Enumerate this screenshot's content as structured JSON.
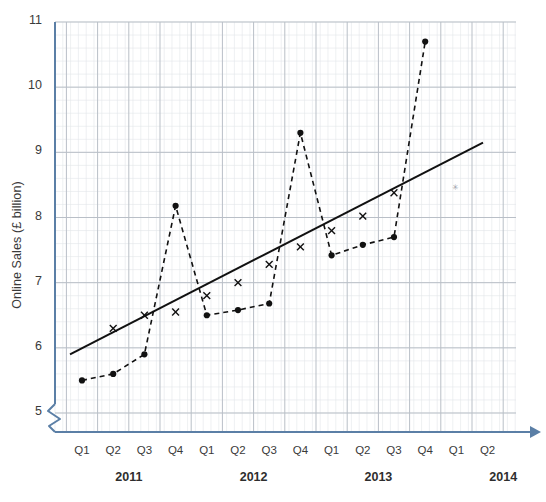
{
  "chart_data": {
    "type": "line",
    "title": "",
    "xlabel": "",
    "ylabel": "Online Sales (£ billion)",
    "ylim": [
      5,
      11
    ],
    "yticks": [
      5,
      6,
      7,
      8,
      9,
      10,
      11
    ],
    "ytick_labels": [
      "5",
      "6",
      "7",
      "8",
      "9",
      "10",
      "11"
    ],
    "axis_break": true,
    "grid": true,
    "grid_minor": true,
    "legend": "none",
    "x": [
      "Q1 2011",
      "Q2 2011",
      "Q3 2011",
      "Q4 2011",
      "Q1 2012",
      "Q2 2012",
      "Q3 2012",
      "Q4 2012",
      "Q1 2013",
      "Q2 2013",
      "Q3 2013",
      "Q4 2013"
    ],
    "xticks": [
      "Q1",
      "Q2",
      "Q3",
      "Q4",
      "Q1",
      "Q2",
      "Q3",
      "Q4",
      "Q1",
      "Q2",
      "Q3",
      "Q4",
      "Q1",
      "Q2"
    ],
    "xtick_years": [
      "2011",
      "2012",
      "2013",
      "2014"
    ],
    "series": [
      {
        "name": "Actual online sales",
        "style": "dashed",
        "marker": "filled-circle",
        "color": "#111111",
        "values": [
          5.5,
          5.6,
          5.9,
          8.18,
          6.5,
          6.58,
          6.68,
          9.3,
          7.42,
          7.58,
          7.7,
          10.7
        ]
      },
      {
        "name": "Trend",
        "style": "dashed-with-x",
        "marker": "x-cross",
        "color": "#111111",
        "values": [
          null,
          6.3,
          6.5,
          6.55,
          6.8,
          7.0,
          7.28,
          7.55,
          7.8,
          8.02,
          8.38,
          null
        ]
      },
      {
        "name": "Trend line (fitted)",
        "style": "solid",
        "marker": "none",
        "color": "#111111",
        "start": {
          "x": "Q1 2011",
          "y": 5.9
        },
        "end": {
          "x": "Q1 2014",
          "y": 9.15
        }
      }
    ]
  },
  "axes": {
    "y_axis_color": "#5b7fa6",
    "x_axis_color": "#5b7fa6",
    "grid_major_color": "#b9bfc7",
    "grid_minor_color": "#e3e6ea",
    "arrow": "right-arrow-icon"
  }
}
